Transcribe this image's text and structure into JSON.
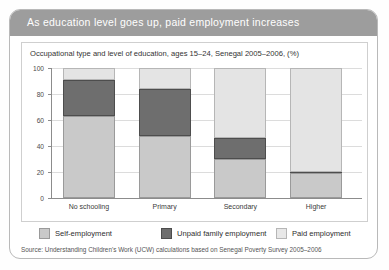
{
  "card": {
    "header_title": "As education level goes up, paid employment increases",
    "source_note": "Source: Understanding Children's Work (UCW) calculations based on Senegal Poverty Survey 2005–2006"
  },
  "chart_data": {
    "type": "bar",
    "stacked": true,
    "title": "Occupational type and level of education, ages 15–24, Senegal 2005–2006, (%)",
    "xlabel": "",
    "ylabel": "",
    "ylim": [
      0,
      100
    ],
    "yticks": [
      0,
      20,
      40,
      60,
      80,
      100
    ],
    "grid": true,
    "legend_position": "bottom",
    "categories": [
      "No schooling",
      "Primary",
      "Secondary",
      "Higher"
    ],
    "series": [
      {
        "name": "Self-employment",
        "color": "#c9c9c9",
        "values": [
          63,
          48,
          30,
          19
        ]
      },
      {
        "name": "Unpaid family employment",
        "color": "#6e6e6e",
        "values": [
          28,
          36,
          16,
          1
        ]
      },
      {
        "name": "Paid employment",
        "color": "#e4e4e4",
        "values": [
          9,
          16,
          54,
          80
        ]
      }
    ]
  }
}
